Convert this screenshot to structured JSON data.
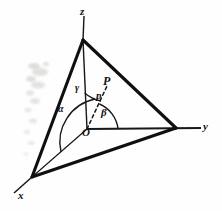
{
  "figure": {
    "type": "geometric-diagram",
    "background_color": "#ffffff",
    "line_color": "#111111"
  },
  "axes": {
    "z_label": "z",
    "y_label": "y",
    "x_label": "x",
    "origin_label": "O"
  },
  "points": {
    "point_label": "P",
    "vector_label": "p"
  },
  "angles": {
    "alpha": "α",
    "beta": "β",
    "gamma": "γ"
  },
  "geometry": {
    "origin": [
      87,
      129
    ],
    "z_apex": [
      83,
      40
    ],
    "x_vertex": [
      32,
      177
    ],
    "y_vertex": [
      176,
      128
    ],
    "z_axis_tip": [
      84,
      16
    ],
    "y_axis_tip": [
      201,
      128
    ],
    "x_axis_tip": [
      14,
      193
    ],
    "vector_tip": [
      104,
      92
    ]
  }
}
